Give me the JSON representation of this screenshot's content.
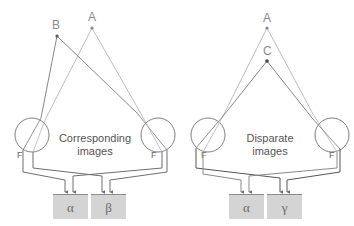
{
  "colors": {
    "background": "#ffffff",
    "ray_light": "#b5b5b5",
    "ray_dark": "#7a7a7a",
    "point": "#555555",
    "eye": "#707070",
    "fiber": "#6e6e6e",
    "box": "#d4d4d4",
    "box_border": "#8c8c8c"
  },
  "left_panel": {
    "points": [
      {
        "label": "B"
      },
      {
        "label": "A"
      }
    ],
    "caption_line1": "Corresponding",
    "caption_line2": "images",
    "left_eye_label": "F",
    "right_eye_label": "F",
    "boxes": [
      {
        "label": "α"
      },
      {
        "label": "β"
      }
    ]
  },
  "right_panel": {
    "points": [
      {
        "label": "A"
      },
      {
        "label": "C"
      }
    ],
    "caption_line1": "Disparate",
    "caption_line2": "images",
    "left_eye_label": "F",
    "right_eye_label": "F",
    "boxes": [
      {
        "label": "α"
      },
      {
        "label": "γ"
      }
    ]
  }
}
